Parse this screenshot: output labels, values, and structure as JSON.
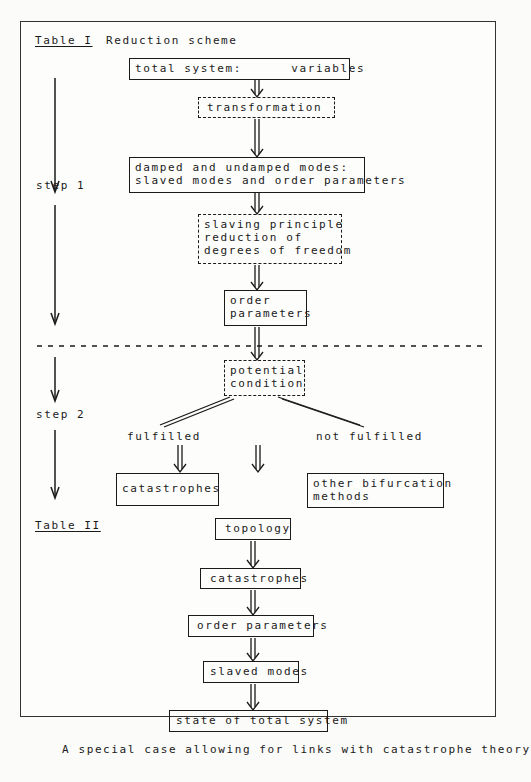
{
  "table1": {
    "label": "Table I",
    "title": "Reduction scheme",
    "step1": "step 1",
    "step2": "step 2",
    "nodes": {
      "total_system": "total system:      variables",
      "transformation": "transformation",
      "modes_line1": "damped and undamped modes:",
      "modes_line2": "slaved modes and order parameters",
      "slaving_line1": "slaving principle",
      "slaving_line2": "reduction of",
      "slaving_line3": "degrees of freedom",
      "order_line1": "order",
      "order_line2": "parameters",
      "potential_line1": "potential",
      "potential_line2": "condition",
      "fulfilled": "fulfilled",
      "not_fulfilled": "not fulfilled",
      "catastrophes": "catastrophes",
      "other_line1": "other bifurcation",
      "other_line2": "methods"
    }
  },
  "table2": {
    "label": "Table II",
    "nodes": [
      "topology",
      "catastrophes",
      "order parameters",
      "slaved modes",
      "state of total system"
    ]
  },
  "caption": "A special case allowing for links with catastrophe theory"
}
